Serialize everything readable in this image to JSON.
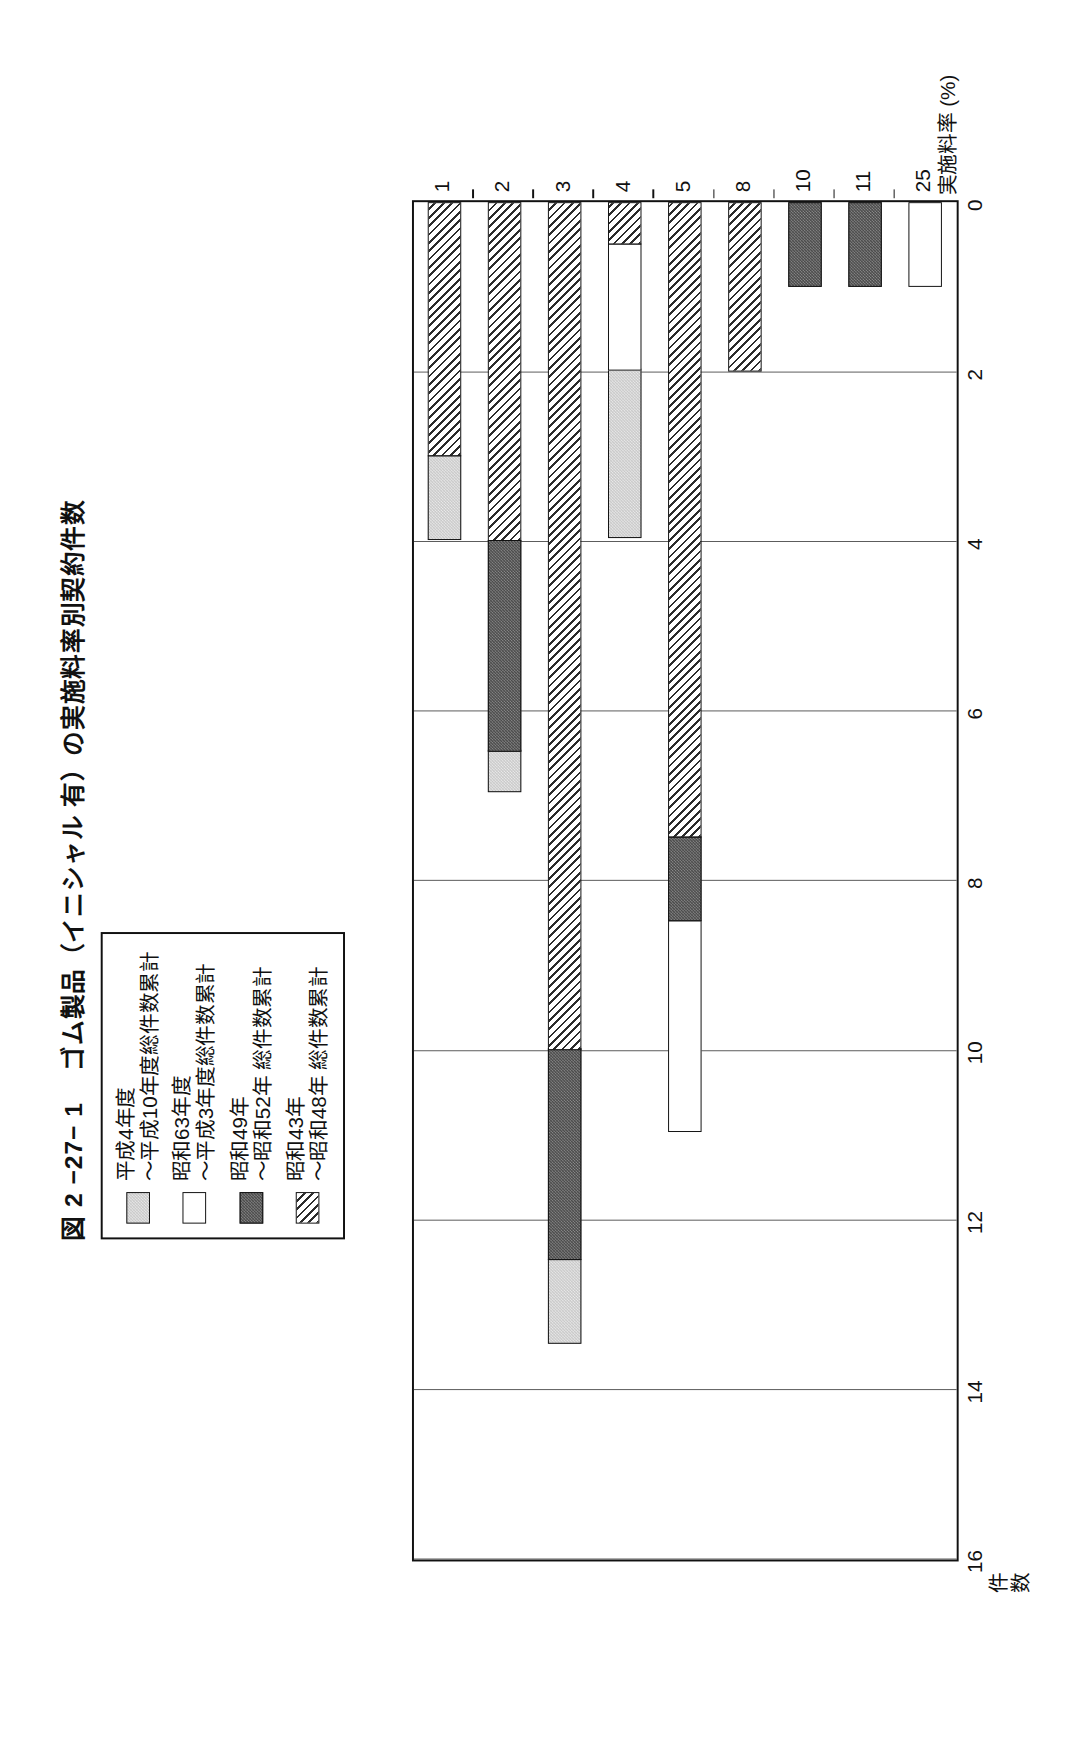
{
  "figure": {
    "number": "図 2 −27− 1",
    "title": "ゴム製品（イニシャル 有）の実施料率別契約件数"
  },
  "legend": {
    "items": [
      {
        "name": "平成4年度",
        "line2": "〜平成10年度総件数累計",
        "swatch": "light-gray-dotted",
        "color": "#c9c9c9"
      },
      {
        "name": "昭和63年度",
        "line2": "〜平成3年度総件数累計",
        "swatch": "white",
        "color": "#ffffff"
      },
      {
        "name": "昭和49年",
        "line2": "〜昭和52年 総件数累計",
        "swatch": "dark-dotted",
        "color": "#4a4a4a"
      },
      {
        "name": "昭和43年",
        "line2": "〜昭和48年 総件数累計",
        "swatch": "diagonal-hatch",
        "color": "#2b2b2b"
      }
    ]
  },
  "axes": {
    "value_axis_title_line1": "件",
    "value_axis_title_line2": "数",
    "value_ticks": [
      "16",
      "14",
      "12",
      "10",
      "8",
      "6",
      "4",
      "2",
      "0"
    ],
    "category_axis_title": "実施料率 (%)",
    "category_ticks": [
      "1",
      "2",
      "3",
      "4",
      "5",
      "8",
      "10",
      "11",
      "25"
    ]
  },
  "chart_data": {
    "type": "bar",
    "title": "ゴム製品（イニシャル 有）の実施料率別契約件数",
    "xlabel": "実施料率 (%)",
    "ylabel": "件数",
    "ylim": [
      0,
      16
    ],
    "grid": true,
    "orientation": "horizontal",
    "stacked": true,
    "legend_position": "top-left",
    "categories": [
      "1",
      "2",
      "3",
      "4",
      "5",
      "8",
      "10",
      "11",
      "25"
    ],
    "series": [
      {
        "name": "昭和43年〜昭和48年 総件数累計",
        "swatch": "diagonal-hatch",
        "values": [
          3,
          4,
          10,
          0.5,
          7.5,
          2,
          0,
          0,
          0
        ]
      },
      {
        "name": "昭和49年〜昭和52年 総件数累計",
        "swatch": "dark-dotted",
        "values": [
          0,
          2.5,
          2.5,
          0,
          1,
          0,
          1,
          1,
          0
        ]
      },
      {
        "name": "昭和63年度〜平成3年度総件数累計",
        "swatch": "white",
        "values": [
          0,
          0,
          0,
          1.5,
          2.5,
          0,
          0,
          0,
          1
        ]
      },
      {
        "name": "平成4年度〜平成10年度総件数累計",
        "swatch": "light-gray-dotted",
        "values": [
          1,
          0.5,
          1,
          2,
          0,
          0,
          0,
          0,
          0
        ]
      }
    ],
    "totals": [
      4,
      7,
      14,
      4,
      11,
      2,
      1,
      1,
      1
    ]
  }
}
